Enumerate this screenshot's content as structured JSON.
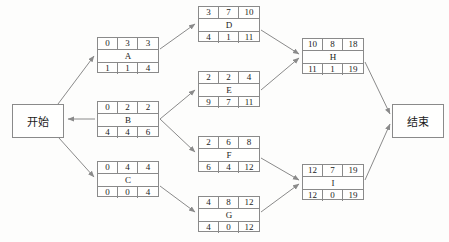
{
  "diagram": {
    "line_color": "#8a8a8a",
    "text_color": "#1b1b1b",
    "background": "#fdfdfc"
  },
  "terminals": {
    "start": {
      "label": "开始"
    },
    "end": {
      "label": "结束"
    }
  },
  "nodes": [
    {
      "id": "A",
      "name": "A",
      "top": [
        "0",
        "3",
        "3"
      ],
      "bottom": [
        "1",
        "1",
        "4"
      ],
      "x": 97,
      "y": 37
    },
    {
      "id": "B",
      "name": "B",
      "top": [
        "0",
        "2",
        "2"
      ],
      "bottom": [
        "4",
        "4",
        "6"
      ],
      "x": 97,
      "y": 101
    },
    {
      "id": "C",
      "name": "C",
      "top": [
        "0",
        "4",
        "4"
      ],
      "bottom": [
        "0",
        "0",
        "4"
      ],
      "x": 97,
      "y": 161
    },
    {
      "id": "D",
      "name": "D",
      "top": [
        "3",
        "7",
        "10"
      ],
      "bottom": [
        "4",
        "1",
        "11"
      ],
      "x": 198,
      "y": 6
    },
    {
      "id": "E",
      "name": "E",
      "top": [
        "2",
        "2",
        "4"
      ],
      "bottom": [
        "9",
        "7",
        "11"
      ],
      "x": 198,
      "y": 71
    },
    {
      "id": "F",
      "name": "F",
      "top": [
        "2",
        "6",
        "8"
      ],
      "bottom": [
        "6",
        "4",
        "12"
      ],
      "x": 198,
      "y": 136
    },
    {
      "id": "G",
      "name": "G",
      "top": [
        "4",
        "8",
        "12"
      ],
      "bottom": [
        "4",
        "0",
        "12"
      ],
      "x": 198,
      "y": 196
    },
    {
      "id": "H",
      "name": "H",
      "top": [
        "10",
        "8",
        "18"
      ],
      "bottom": [
        "11",
        "1",
        "19"
      ],
      "x": 302,
      "y": 38
    },
    {
      "id": "I",
      "name": "I",
      "top": [
        "12",
        "7",
        "19"
      ],
      "bottom": [
        "12",
        "0",
        "19"
      ],
      "x": 302,
      "y": 164
    }
  ],
  "terminal_positions": {
    "start": {
      "x": 12,
      "y": 104
    },
    "end": {
      "x": 392,
      "y": 104
    }
  },
  "edges": [
    {
      "from": "start",
      "to": "A"
    },
    {
      "from": "start",
      "to": "B"
    },
    {
      "from": "start",
      "to": "C"
    },
    {
      "from": "A",
      "to": "D"
    },
    {
      "from": "B",
      "to": "E"
    },
    {
      "from": "B",
      "to": "F"
    },
    {
      "from": "C",
      "to": "G"
    },
    {
      "from": "D",
      "to": "H"
    },
    {
      "from": "E",
      "to": "H"
    },
    {
      "from": "F",
      "to": "I"
    },
    {
      "from": "G",
      "to": "I"
    },
    {
      "from": "H",
      "to": "end"
    },
    {
      "from": "I",
      "to": "end"
    }
  ],
  "legend": {
    "cell_meaning_top": [
      "ES",
      "Duration",
      "EF"
    ],
    "cell_meaning_bottom": [
      "LS",
      "Slack",
      "LF"
    ]
  }
}
